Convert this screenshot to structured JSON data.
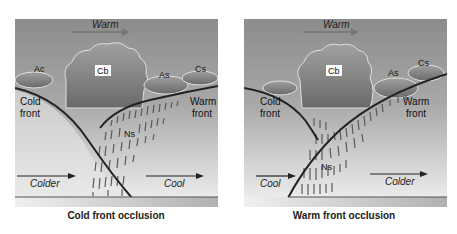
{
  "panels": [
    {
      "id": "cold-front-occlusion",
      "caption": "Cold front occlusion",
      "labels": {
        "warm": "Warm",
        "cb": "Cb",
        "ac": "Ac",
        "as": "As",
        "cs": "Cs",
        "ns": "Ns",
        "cold_front_1": "Cold",
        "cold_front_2": "front",
        "warm_front_1": "Warm",
        "warm_front_2": "front",
        "left_air": "Colder",
        "right_air": "Cool"
      }
    },
    {
      "id": "warm-front-occlusion",
      "caption": "Warm front occlusion",
      "labels": {
        "warm": "Warm",
        "cb": "Cb",
        "as": "As",
        "cs": "Cs",
        "ns": "Ns",
        "cold_front_1": "Cold",
        "cold_front_2": "front",
        "warm_front_1": "Warm",
        "warm_front_2": "front",
        "left_air": "Cool",
        "right_air": "Colder"
      }
    }
  ],
  "colors": {
    "sky_top": "#8a8a8a",
    "sky_bottom": "#cfcfcf",
    "cloud": "#7d7d7d",
    "front_line": "#2a2a2a",
    "rain": "#555555",
    "ground": "#b5b5b5"
  }
}
